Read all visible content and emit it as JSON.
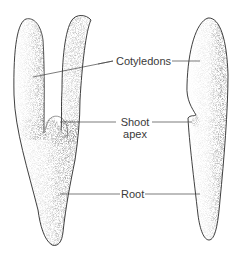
{
  "diagram": {
    "views": [
      {
        "name": "left-view",
        "description": "front view with two cotyledons and shoot apex between them"
      },
      {
        "name": "right-view",
        "description": "side view"
      }
    ],
    "labels": {
      "cotyledons": "Cotyledons",
      "shoot_apex_line1": "Shoot",
      "shoot_apex_line2": "apex",
      "root": "Root"
    },
    "colors": {
      "outline": "#2a2a2a",
      "stipple": "#555555",
      "leader_line": "#444444",
      "text": "#3a3a3a",
      "background": "#ffffff"
    }
  }
}
